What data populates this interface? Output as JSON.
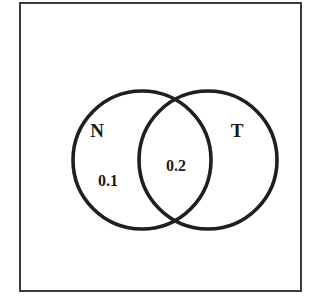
{
  "figure": {
    "kind": "venn-diagram",
    "background_color": "#ffffff",
    "ink_color": "#1f1f1f",
    "frame": {
      "name": "universal-set-box",
      "stroke_color": "#3a3a3a",
      "stroke_width": 2,
      "x": 20,
      "y": 3,
      "width": 281,
      "height": 288,
      "fill": "#ffffff"
    },
    "sets": [
      {
        "id": "set-n",
        "label": "N",
        "label_x": 97,
        "label_y": 137,
        "center_x": 142,
        "center_y": 160,
        "radius": 69,
        "stroke_color": "#1f1f1f",
        "stroke_width": 3.6
      },
      {
        "id": "set-t",
        "label": "T",
        "label_x": 237,
        "label_y": 137,
        "center_x": 208,
        "center_y": 160,
        "radius": 69,
        "stroke_color": "#1f1f1f",
        "stroke_width": 3.6
      }
    ],
    "region_values": [
      {
        "id": "region-n-only",
        "value": "0.1",
        "x": 108,
        "y": 186,
        "region": "N only"
      },
      {
        "id": "region-intersection",
        "value": "0.2",
        "x": 176,
        "y": 171,
        "region": "N and T"
      }
    ]
  },
  "chart_data": {
    "type": "diagram",
    "diagram_type": "venn",
    "title": "",
    "sets": [
      "N",
      "T"
    ],
    "region_labels": [
      "0.1",
      "0.2"
    ],
    "regions": [
      {
        "sets": [
          "N"
        ],
        "label": "0.1",
        "value": 0.1
      },
      {
        "sets": [
          "N",
          "T"
        ],
        "label": "0.2",
        "value": 0.2
      }
    ]
  }
}
